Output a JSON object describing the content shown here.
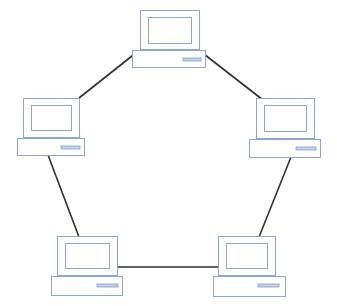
{
  "diagram": {
    "type": "ring-network-topology",
    "colors": {
      "background": "#ffffff",
      "link": "#2f2f2f",
      "computer_outline": "#8aa6d4",
      "drive_slot": "#7f9fd0"
    },
    "nodes": [
      {
        "id": "top",
        "monitor": [
          140,
          10,
          59,
          39
        ],
        "screen": [
          148,
          17,
          43,
          26
        ],
        "base": [
          132,
          50,
          73,
          17
        ],
        "slot": [
          183,
          58,
          18,
          3
        ]
      },
      {
        "id": "left",
        "monitor": [
          23,
          98,
          56,
          39
        ],
        "screen": [
          31,
          105,
          40,
          25
        ],
        "base": [
          17,
          138,
          67,
          17
        ],
        "slot": [
          61,
          146,
          19,
          3
        ]
      },
      {
        "id": "right",
        "monitor": [
          256,
          98,
          58,
          40
        ],
        "screen": [
          264,
          105,
          42,
          26
        ],
        "base": [
          249,
          139,
          71,
          18
        ],
        "slot": [
          296,
          147,
          20,
          3
        ]
      },
      {
        "id": "bottom-left",
        "monitor": [
          57,
          236,
          60,
          39
        ],
        "screen": [
          65,
          243,
          44,
          25
        ],
        "base": [
          51,
          276,
          71,
          19
        ],
        "slot": [
          97,
          284,
          21,
          3
        ]
      },
      {
        "id": "bottom-right",
        "monitor": [
          218,
          236,
          57,
          39
        ],
        "screen": [
          226,
          243,
          41,
          25
        ],
        "base": [
          213,
          276,
          72,
          20
        ],
        "slot": [
          258,
          284,
          21,
          3
        ]
      }
    ],
    "links": [
      {
        "from": "top",
        "to": "left",
        "points": [
          137,
          52,
          79,
          98
        ]
      },
      {
        "from": "top",
        "to": "right",
        "points": [
          200,
          51,
          263,
          100
        ]
      },
      {
        "from": "left",
        "to": "bottom-left",
        "points": [
          48,
          155,
          79,
          237
        ]
      },
      {
        "from": "right",
        "to": "bottom-right",
        "points": [
          291,
          157,
          259,
          237
        ]
      },
      {
        "from": "bottom-left",
        "to": "bottom-right",
        "points": [
          117,
          267,
          219,
          267
        ]
      }
    ]
  }
}
